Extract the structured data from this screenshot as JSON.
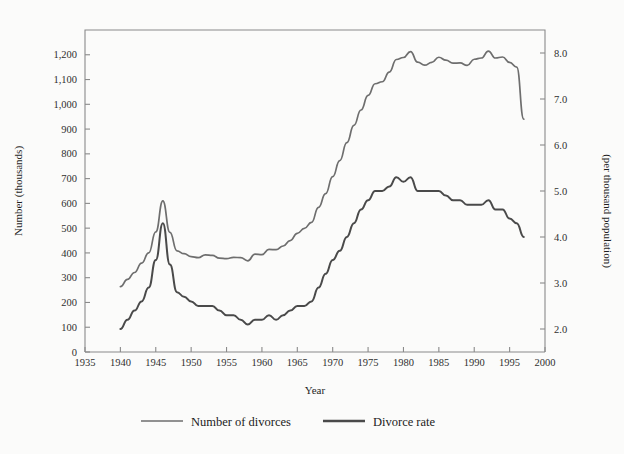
{
  "figure": {
    "background_color": "#fbfbfa",
    "frame_color": "#8a8a8a"
  },
  "chart_data": {
    "type": "line",
    "title": "",
    "xlabel": "Year",
    "ylabel": "Number (thousands)",
    "y2label": "(per thousand population)",
    "xlim": [
      1935,
      2000
    ],
    "ylim": [
      0,
      1300
    ],
    "y2lim": [
      1.5,
      8.5
    ],
    "grid": false,
    "legend_position": "bottom",
    "xticks": [
      1935,
      1940,
      1945,
      1950,
      1955,
      1960,
      1965,
      1970,
      1975,
      1980,
      1985,
      1990,
      1995,
      2000
    ],
    "xticklabels": [
      "1935",
      "1940",
      "1945",
      "1950",
      "1955",
      "1960",
      "1965",
      "1970",
      "1975",
      "1980",
      "1985",
      "1990",
      "1995",
      "2000"
    ],
    "yticks": [
      0,
      100,
      200,
      300,
      400,
      500,
      600,
      700,
      800,
      900,
      1000,
      1100,
      1200
    ],
    "yticklabels": [
      "0",
      "100",
      "200",
      "300",
      "400",
      "500",
      "600",
      "700",
      "800",
      "900",
      "1,000",
      "1,100",
      "1,200"
    ],
    "y2ticks": [
      2.0,
      3.0,
      4.0,
      5.0,
      6.0,
      7.0,
      8.0
    ],
    "y2ticklabels": [
      "2.0",
      "3.0",
      "4.0",
      "5.0",
      "6.0",
      "7.0",
      "8.0"
    ],
    "series": [
      {
        "name": "Number of divorces",
        "axis": "left",
        "color": "#6e6e6e",
        "width": 1.7,
        "x": [
          1940,
          1941,
          1942,
          1943,
          1944,
          1945,
          1946,
          1947,
          1948,
          1949,
          1950,
          1951,
          1952,
          1953,
          1954,
          1955,
          1956,
          1957,
          1958,
          1959,
          1960,
          1961,
          1962,
          1963,
          1964,
          1965,
          1966,
          1967,
          1968,
          1969,
          1970,
          1971,
          1972,
          1973,
          1974,
          1975,
          1976,
          1977,
          1978,
          1979,
          1980,
          1981,
          1982,
          1983,
          1984,
          1985,
          1986,
          1987,
          1988,
          1989,
          1990,
          1991,
          1992,
          1993,
          1994,
          1995,
          1996,
          1997
        ],
        "values": [
          264,
          293,
          321,
          359,
          400,
          485,
          610,
          483,
          408,
          397,
          385,
          381,
          392,
          390,
          379,
          377,
          382,
          381,
          368,
          395,
          393,
          414,
          413,
          428,
          450,
          479,
          499,
          523,
          584,
          639,
          708,
          773,
          845,
          915,
          977,
          1036,
          1083,
          1091,
          1130,
          1181,
          1189,
          1213,
          1170,
          1158,
          1169,
          1190,
          1178,
          1166,
          1167,
          1157,
          1182,
          1187,
          1215,
          1187,
          1191,
          1169,
          1150,
          940
        ]
      },
      {
        "name": "Divorce rate",
        "axis": "right",
        "color": "#4a4a4a",
        "width": 2.0,
        "x": [
          1940,
          1941,
          1942,
          1943,
          1944,
          1945,
          1946,
          1947,
          1948,
          1949,
          1950,
          1951,
          1952,
          1953,
          1954,
          1955,
          1956,
          1957,
          1958,
          1959,
          1960,
          1961,
          1962,
          1963,
          1964,
          1965,
          1966,
          1967,
          1968,
          1969,
          1970,
          1971,
          1972,
          1973,
          1974,
          1975,
          1976,
          1977,
          1978,
          1979,
          1980,
          1981,
          1982,
          1983,
          1984,
          1985,
          1986,
          1987,
          1988,
          1989,
          1990,
          1991,
          1992,
          1993,
          1994,
          1995,
          1996,
          1997
        ],
        "values": [
          2.0,
          2.2,
          2.4,
          2.6,
          2.9,
          3.5,
          4.3,
          3.4,
          2.8,
          2.7,
          2.6,
          2.5,
          2.5,
          2.5,
          2.4,
          2.3,
          2.3,
          2.2,
          2.1,
          2.2,
          2.2,
          2.3,
          2.2,
          2.3,
          2.4,
          2.5,
          2.5,
          2.6,
          2.9,
          3.2,
          3.5,
          3.7,
          4.0,
          4.3,
          4.6,
          4.8,
          5.0,
          5.0,
          5.1,
          5.3,
          5.2,
          5.3,
          5.0,
          5.0,
          5.0,
          5.0,
          4.9,
          4.8,
          4.8,
          4.7,
          4.7,
          4.7,
          4.8,
          4.6,
          4.6,
          4.4,
          4.3,
          4.0
        ]
      }
    ]
  },
  "legend": {
    "items": [
      {
        "label": "Number of divorces",
        "color": "#6e6e6e",
        "width": 1.7
      },
      {
        "label": "Divorce rate",
        "color": "#4a4a4a",
        "width": 2.4
      }
    ]
  },
  "caption": {
    "text": ""
  }
}
